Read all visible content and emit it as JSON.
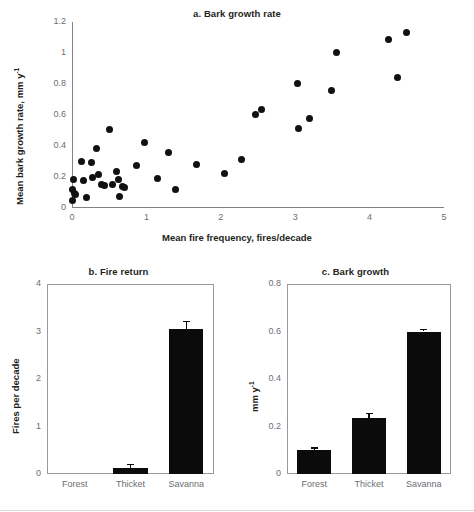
{
  "figure": {
    "panels": [
      "a",
      "b",
      "c"
    ]
  },
  "panel_a": {
    "title": "a. Bark growth rate",
    "xlabel": "Mean fire frequency, fires/decade",
    "ylabel_pre": "Mean bark growth rate, mm y",
    "ylabel_sup": "-1",
    "xticks": [
      "0",
      "1",
      "2",
      "3",
      "4",
      "5"
    ],
    "yticks": [
      "0",
      "0.2",
      "0.4",
      "0.6",
      "0.8",
      "1",
      "1.2"
    ]
  },
  "panel_b": {
    "title": "b. Fire return",
    "ylabel": "Fires per decade",
    "yticks": [
      "0",
      "1",
      "2",
      "3",
      "4"
    ],
    "categories": [
      "Forest",
      "Thicket",
      "Savanna"
    ]
  },
  "panel_c": {
    "title": "c. Bark growth",
    "ylabel_pre": "mm y",
    "ylabel_sup": "-1",
    "yticks": [
      "0",
      "0.2",
      "0.4",
      "0.6",
      "0.8"
    ],
    "categories": [
      "Forest",
      "Thicket",
      "Savanna"
    ]
  },
  "colors": {
    "bar_fill": "#0b0b0b",
    "point_fill": "#111111",
    "axis": "#808285",
    "frame": "#9a9b9e",
    "tick_text": "#6d6e71",
    "title_text": "#231f20",
    "background": "#ffffff"
  },
  "chart_data": [
    {
      "type": "scatter",
      "panel": "a",
      "title": "a. Bark growth rate",
      "xlabel": "Mean fire frequency, fires/decade",
      "ylabel": "Mean bark growth rate, mm y-1",
      "xlim": [
        0,
        5
      ],
      "ylim": [
        0,
        1.2
      ],
      "xticks": [
        0,
        1,
        2,
        3,
        4,
        5
      ],
      "yticks": [
        0,
        0.2,
        0.4,
        0.6,
        0.8,
        1.0,
        1.2
      ],
      "grid": false,
      "legend": "none",
      "points": [
        {
          "x": 0.0,
          "y": 0.05
        },
        {
          "x": 0.01,
          "y": 0.12
        },
        {
          "x": 0.02,
          "y": 0.185
        },
        {
          "x": 0.04,
          "y": 0.095
        },
        {
          "x": 0.05,
          "y": 0.085
        },
        {
          "x": 0.13,
          "y": 0.3
        },
        {
          "x": 0.15,
          "y": 0.175
        },
        {
          "x": 0.2,
          "y": 0.065
        },
        {
          "x": 0.26,
          "y": 0.295
        },
        {
          "x": 0.27,
          "y": 0.2
        },
        {
          "x": 0.33,
          "y": 0.385
        },
        {
          "x": 0.35,
          "y": 0.215
        },
        {
          "x": 0.4,
          "y": 0.15
        },
        {
          "x": 0.44,
          "y": 0.148
        },
        {
          "x": 0.5,
          "y": 0.505
        },
        {
          "x": 0.55,
          "y": 0.152
        },
        {
          "x": 0.6,
          "y": 0.235
        },
        {
          "x": 0.62,
          "y": 0.185
        },
        {
          "x": 0.64,
          "y": 0.072
        },
        {
          "x": 0.68,
          "y": 0.14
        },
        {
          "x": 0.7,
          "y": 0.135
        },
        {
          "x": 0.87,
          "y": 0.275
        },
        {
          "x": 0.98,
          "y": 0.42
        },
        {
          "x": 1.15,
          "y": 0.19
        },
        {
          "x": 1.3,
          "y": 0.355
        },
        {
          "x": 1.39,
          "y": 0.12
        },
        {
          "x": 1.68,
          "y": 0.28
        },
        {
          "x": 2.05,
          "y": 0.22
        },
        {
          "x": 2.28,
          "y": 0.31
        },
        {
          "x": 2.47,
          "y": 0.605
        },
        {
          "x": 2.55,
          "y": 0.635
        },
        {
          "x": 3.03,
          "y": 0.805
        },
        {
          "x": 3.05,
          "y": 0.51
        },
        {
          "x": 3.19,
          "y": 0.58
        },
        {
          "x": 3.49,
          "y": 0.755
        },
        {
          "x": 3.56,
          "y": 1.005
        },
        {
          "x": 4.25,
          "y": 1.09
        },
        {
          "x": 4.38,
          "y": 0.84
        },
        {
          "x": 4.5,
          "y": 1.135
        }
      ]
    },
    {
      "type": "bar",
      "panel": "b",
      "title": "b. Fire return",
      "xlabel": "",
      "ylabel": "Fires per decade",
      "ylim": [
        0,
        4
      ],
      "yticks": [
        0,
        1,
        2,
        3,
        4
      ],
      "grid": false,
      "legend": "none",
      "categories": [
        "Forest",
        "Thicket",
        "Savanna"
      ],
      "values": [
        0.0,
        0.12,
        3.05
      ],
      "errors": [
        0.0,
        0.1,
        0.17
      ]
    },
    {
      "type": "bar",
      "panel": "c",
      "title": "c. Bark growth",
      "xlabel": "",
      "ylabel": "mm y-1",
      "ylim": [
        0,
        0.8
      ],
      "yticks": [
        0,
        0.2,
        0.4,
        0.6,
        0.8
      ],
      "grid": false,
      "legend": "none",
      "categories": [
        "Forest",
        "Thicket",
        "Savanna"
      ],
      "values": [
        0.1,
        0.235,
        0.6
      ],
      "errors": [
        0.012,
        0.022,
        0.012
      ]
    }
  ]
}
